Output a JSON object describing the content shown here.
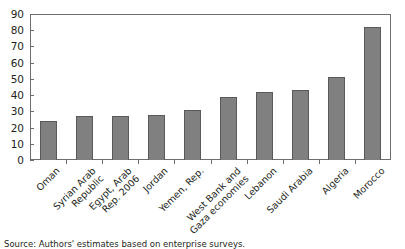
{
  "chart_data": {
    "type": "bar",
    "title": "",
    "subtitle": "",
    "xlabel": "",
    "ylabel": "",
    "ylim": [
      0,
      90
    ],
    "ytick_step": 10,
    "yticks": [
      "0",
      "10",
      "20",
      "30",
      "40",
      "50",
      "60",
      "70",
      "80",
      "90"
    ],
    "grid": false,
    "legend": null,
    "bar_color": "#808080",
    "bar_edge_color": "#59595b",
    "frame_color": "#6d6e71",
    "categories": [
      "Oman",
      "Syrian Arab\nRepublic",
      "Egypt, Arab\nRep. 2006",
      "Jordan",
      "Yemen, Rep.",
      "West Bank and\nGaza economies",
      "Lebanon",
      "Saudi Arabia",
      "Algeria",
      "Morocco"
    ],
    "values": [
      24,
      27,
      27,
      28,
      31,
      39,
      42,
      43,
      51,
      82
    ]
  },
  "notes": {
    "source": "Source: Authors' estimates based on enterprise surveys."
  }
}
